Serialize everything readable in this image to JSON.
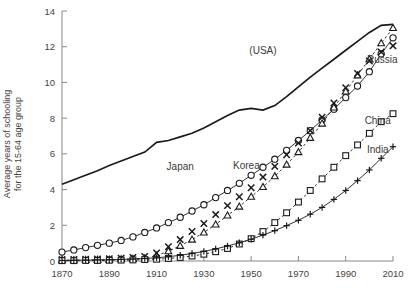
{
  "chart_data": {
    "type": "line",
    "title": "",
    "xlabel": "",
    "ylabel": "Average years of schooling\nfor the 15-64 age group",
    "xlim": [
      1870,
      2010
    ],
    "ylim": [
      0,
      14
    ],
    "xticks": [
      1870,
      1890,
      1910,
      1930,
      1950,
      1970,
      1990,
      2010
    ],
    "yticks": [
      0,
      2,
      4,
      6,
      8,
      10,
      12,
      14
    ],
    "grid": false,
    "legend": "inline-annotations",
    "x": [
      1870,
      1875,
      1880,
      1885,
      1890,
      1895,
      1900,
      1905,
      1910,
      1915,
      1920,
      1925,
      1930,
      1935,
      1940,
      1945,
      1950,
      1955,
      1960,
      1965,
      1970,
      1975,
      1980,
      1985,
      1990,
      1995,
      2000,
      2005,
      2010
    ],
    "series": [
      {
        "name": "(USA)",
        "marker": "none",
        "linestyle": "solid",
        "label_x": 1955,
        "label_y": 11.6,
        "values": [
          4.3,
          4.55,
          4.8,
          5.05,
          5.35,
          5.6,
          5.85,
          6.1,
          6.65,
          6.75,
          6.95,
          7.15,
          7.45,
          7.8,
          8.15,
          8.45,
          8.55,
          8.45,
          8.7,
          9.2,
          9.75,
          10.3,
          10.8,
          11.3,
          11.8,
          12.3,
          12.8,
          13.2,
          13.25
        ]
      },
      {
        "name": "Japan",
        "marker": "circle",
        "linestyle": "solid",
        "label_x": 1920,
        "label_y": 5.1,
        "values": [
          0.5,
          0.62,
          0.75,
          0.88,
          1.0,
          1.15,
          1.35,
          1.6,
          1.85,
          2.15,
          2.45,
          2.8,
          3.15,
          3.55,
          3.95,
          4.35,
          4.8,
          5.25,
          5.7,
          6.2,
          6.75,
          7.3,
          7.9,
          8.5,
          9.15,
          9.8,
          10.6,
          11.6,
          12.5
        ]
      },
      {
        "name": "Korea",
        "marker": "triangle",
        "linestyle": "dashed",
        "label_x": 1948,
        "label_y": 5.15,
        "values": [
          0.05,
          0.05,
          0.06,
          0.07,
          0.08,
          0.1,
          0.12,
          0.15,
          0.3,
          0.55,
          0.85,
          1.2,
          1.6,
          2.05,
          2.55,
          3.05,
          3.6,
          4.15,
          4.75,
          5.4,
          6.1,
          6.9,
          7.7,
          8.6,
          9.5,
          10.4,
          11.3,
          12.2,
          13.05
        ]
      },
      {
        "name": "Russia",
        "marker": "x",
        "linestyle": "none",
        "label_x": 1999,
        "label_y": 11.1,
        "values": [
          0.08,
          0.09,
          0.1,
          0.11,
          0.13,
          0.16,
          0.2,
          0.26,
          0.45,
          0.8,
          1.2,
          1.65,
          2.1,
          2.6,
          3.1,
          3.6,
          4.1,
          4.7,
          5.3,
          5.95,
          6.6,
          7.3,
          8.05,
          8.85,
          9.7,
          10.5,
          11.2,
          11.7,
          12.05
        ]
      },
      {
        "name": "China",
        "marker": "square",
        "linestyle": "dashed",
        "label_x": 1998,
        "label_y": 7.7,
        "values": [
          0.02,
          0.02,
          0.03,
          0.03,
          0.04,
          0.05,
          0.06,
          0.08,
          0.1,
          0.14,
          0.2,
          0.28,
          0.38,
          0.52,
          0.7,
          0.95,
          1.25,
          1.65,
          2.15,
          2.7,
          3.3,
          3.95,
          4.6,
          5.25,
          5.9,
          6.5,
          7.15,
          7.8,
          8.25
        ]
      },
      {
        "name": "India",
        "marker": "plus",
        "linestyle": "solid",
        "label_x": 1999,
        "label_y": 6.05,
        "values": [
          0.03,
          0.04,
          0.05,
          0.06,
          0.07,
          0.09,
          0.11,
          0.14,
          0.18,
          0.24,
          0.32,
          0.42,
          0.54,
          0.68,
          0.84,
          1.02,
          1.22,
          1.45,
          1.7,
          1.98,
          2.28,
          2.62,
          3.0,
          3.45,
          3.95,
          4.5,
          5.1,
          5.75,
          6.4
        ]
      }
    ]
  }
}
